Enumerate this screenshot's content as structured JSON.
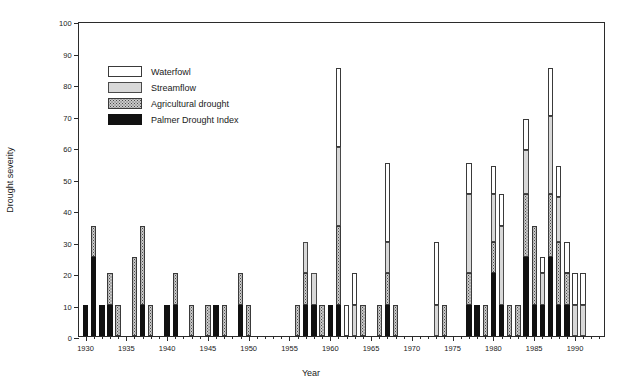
{
  "chart_data": {
    "type": "bar",
    "stacked": true,
    "title": "",
    "xlabel": "Year",
    "ylabel": "Drought severity",
    "xlim": [
      1929.2,
      1993.8
    ],
    "ylim": [
      0,
      100
    ],
    "ytick_step": 10,
    "yticks": [
      0,
      10,
      20,
      30,
      40,
      50,
      60,
      70,
      80,
      90,
      100
    ],
    "ytick_labels": [
      "0",
      "10",
      "20",
      "30",
      "40",
      "50",
      "60",
      "70",
      "80",
      "90",
      "100"
    ],
    "xticks": [
      1930,
      1935,
      1940,
      1945,
      1950,
      1955,
      1960,
      1965,
      1970,
      1975,
      1980,
      1985,
      1990
    ],
    "xtick_labels": [
      "1930",
      "1935",
      "1940",
      "1945",
      "1950",
      "1955",
      "1960",
      "1965",
      "1970",
      "1975",
      "1980",
      "1985",
      "1990"
    ],
    "xtick_minor_step": 1,
    "grid": false,
    "legend_position": "upper left",
    "series": [
      {
        "name": "Palmer Drought Index",
        "key": "palmer",
        "color": "#111111",
        "pattern": "solid-black"
      },
      {
        "name": "Agricultural drought",
        "key": "agri",
        "color": "#c9c9c9",
        "pattern": "dotted"
      },
      {
        "name": "Streamflow",
        "key": "stream",
        "color": "#d8d8d8",
        "pattern": "light-gray"
      },
      {
        "name": "Waterfowl",
        "key": "water",
        "color": "#ffffff",
        "pattern": "white"
      }
    ],
    "stack_order_bottom_to_top": [
      "palmer",
      "agri",
      "stream",
      "water"
    ],
    "categories": [
      1930,
      1931,
      1932,
      1933,
      1934,
      1935,
      1936,
      1937,
      1938,
      1939,
      1940,
      1941,
      1942,
      1943,
      1944,
      1945,
      1946,
      1947,
      1948,
      1949,
      1950,
      1951,
      1952,
      1953,
      1954,
      1955,
      1956,
      1957,
      1958,
      1959,
      1960,
      1961,
      1962,
      1963,
      1964,
      1965,
      1966,
      1967,
      1968,
      1969,
      1970,
      1971,
      1972,
      1973,
      1974,
      1975,
      1976,
      1977,
      1978,
      1979,
      1980,
      1981,
      1982,
      1983,
      1984,
      1985,
      1986,
      1987,
      1988,
      1989,
      1990,
      1991,
      1992,
      1993
    ],
    "bars": [
      {
        "year": 1930,
        "palmer": 10,
        "agri": 0,
        "stream": 0,
        "water": 0,
        "total": 10
      },
      {
        "year": 1931,
        "palmer": 25,
        "agri": 10,
        "stream": 0,
        "water": 0,
        "total": 35
      },
      {
        "year": 1932,
        "palmer": 10,
        "agri": 0,
        "stream": 0,
        "water": 0,
        "total": 10
      },
      {
        "year": 1933,
        "palmer": 10,
        "agri": 10,
        "stream": 0,
        "water": 0,
        "total": 20
      },
      {
        "year": 1934,
        "palmer": 0,
        "agri": 10,
        "stream": 0,
        "water": 0,
        "total": 10
      },
      {
        "year": 1935,
        "palmer": 0,
        "agri": 0,
        "stream": 0,
        "water": 0,
        "total": 0
      },
      {
        "year": 1936,
        "palmer": 0,
        "agri": 25,
        "stream": 0,
        "water": 0,
        "total": 25
      },
      {
        "year": 1937,
        "palmer": 10,
        "agri": 25,
        "stream": 0,
        "water": 0,
        "total": 35
      },
      {
        "year": 1938,
        "palmer": 0,
        "agri": 10,
        "stream": 0,
        "water": 0,
        "total": 10
      },
      {
        "year": 1939,
        "palmer": 0,
        "agri": 0,
        "stream": 0,
        "water": 0,
        "total": 0
      },
      {
        "year": 1940,
        "palmer": 10,
        "agri": 0,
        "stream": 0,
        "water": 0,
        "total": 10
      },
      {
        "year": 1941,
        "palmer": 10,
        "agri": 10,
        "stream": 0,
        "water": 0,
        "total": 20
      },
      {
        "year": 1942,
        "palmer": 0,
        "agri": 0,
        "stream": 0,
        "water": 0,
        "total": 0
      },
      {
        "year": 1943,
        "palmer": 0,
        "agri": 10,
        "stream": 0,
        "water": 0,
        "total": 10
      },
      {
        "year": 1944,
        "palmer": 0,
        "agri": 0,
        "stream": 0,
        "water": 0,
        "total": 0
      },
      {
        "year": 1945,
        "palmer": 0,
        "agri": 10,
        "stream": 0,
        "water": 0,
        "total": 10
      },
      {
        "year": 1946,
        "palmer": 10,
        "agri": 0,
        "stream": 0,
        "water": 0,
        "total": 10
      },
      {
        "year": 1947,
        "palmer": 0,
        "agri": 10,
        "stream": 0,
        "water": 0,
        "total": 10
      },
      {
        "year": 1948,
        "palmer": 0,
        "agri": 0,
        "stream": 0,
        "water": 0,
        "total": 0
      },
      {
        "year": 1949,
        "palmer": 10,
        "agri": 10,
        "stream": 0,
        "water": 0,
        "total": 20
      },
      {
        "year": 1950,
        "palmer": 0,
        "agri": 10,
        "stream": 0,
        "water": 0,
        "total": 10
      },
      {
        "year": 1951,
        "palmer": 0,
        "agri": 0,
        "stream": 0,
        "water": 0,
        "total": 0
      },
      {
        "year": 1952,
        "palmer": 0,
        "agri": 0,
        "stream": 0,
        "water": 0,
        "total": 0
      },
      {
        "year": 1953,
        "palmer": 0,
        "agri": 0,
        "stream": 0,
        "water": 0,
        "total": 0
      },
      {
        "year": 1954,
        "palmer": 0,
        "agri": 0,
        "stream": 0,
        "water": 0,
        "total": 0
      },
      {
        "year": 1955,
        "palmer": 0,
        "agri": 0,
        "stream": 0,
        "water": 0,
        "total": 0
      },
      {
        "year": 1956,
        "palmer": 0,
        "agri": 10,
        "stream": 0,
        "water": 0,
        "total": 10
      },
      {
        "year": 1957,
        "palmer": 10,
        "agri": 10,
        "stream": 10,
        "water": 0,
        "total": 30
      },
      {
        "year": 1958,
        "palmer": 10,
        "agri": 0,
        "stream": 10,
        "water": 0,
        "total": 20
      },
      {
        "year": 1959,
        "palmer": 0,
        "agri": 10,
        "stream": 0,
        "water": 0,
        "total": 10
      },
      {
        "year": 1960,
        "palmer": 10,
        "agri": 0,
        "stream": 0,
        "water": 0,
        "total": 10
      },
      {
        "year": 1961,
        "palmer": 10,
        "agri": 25,
        "stream": 25,
        "water": 25,
        "total": 85
      },
      {
        "year": 1962,
        "palmer": 0,
        "agri": 0,
        "stream": 0,
        "water": 10,
        "total": 10
      },
      {
        "year": 1963,
        "palmer": 0,
        "agri": 0,
        "stream": 10,
        "water": 10,
        "total": 20
      },
      {
        "year": 1964,
        "palmer": 0,
        "agri": 10,
        "stream": 0,
        "water": 0,
        "total": 10
      },
      {
        "year": 1965,
        "palmer": 0,
        "agri": 0,
        "stream": 0,
        "water": 0,
        "total": 0
      },
      {
        "year": 1966,
        "palmer": 0,
        "agri": 10,
        "stream": 0,
        "water": 0,
        "total": 10
      },
      {
        "year": 1967,
        "palmer": 10,
        "agri": 10,
        "stream": 10,
        "water": 25,
        "total": 55
      },
      {
        "year": 1968,
        "palmer": 0,
        "agri": 10,
        "stream": 0,
        "water": 0,
        "total": 10
      },
      {
        "year": 1969,
        "palmer": 0,
        "agri": 0,
        "stream": 0,
        "water": 0,
        "total": 0
      },
      {
        "year": 1970,
        "palmer": 0,
        "agri": 0,
        "stream": 0,
        "water": 0,
        "total": 0
      },
      {
        "year": 1971,
        "palmer": 0,
        "agri": 0,
        "stream": 0,
        "water": 0,
        "total": 0
      },
      {
        "year": 1972,
        "palmer": 0,
        "agri": 0,
        "stream": 0,
        "water": 0,
        "total": 0
      },
      {
        "year": 1973,
        "palmer": 0,
        "agri": 0,
        "stream": 10,
        "water": 20,
        "total": 30
      },
      {
        "year": 1974,
        "palmer": 0,
        "agri": 10,
        "stream": 0,
        "water": 0,
        "total": 10
      },
      {
        "year": 1975,
        "palmer": 0,
        "agri": 0,
        "stream": 0,
        "water": 0,
        "total": 0
      },
      {
        "year": 1976,
        "palmer": 0,
        "agri": 0,
        "stream": 0,
        "water": 0,
        "total": 0
      },
      {
        "year": 1977,
        "palmer": 10,
        "agri": 10,
        "stream": 25,
        "water": 10,
        "total": 55
      },
      {
        "year": 1978,
        "palmer": 10,
        "agri": 0,
        "stream": 0,
        "water": 0,
        "total": 10
      },
      {
        "year": 1979,
        "palmer": 0,
        "agri": 10,
        "stream": 0,
        "water": 0,
        "total": 10
      },
      {
        "year": 1980,
        "palmer": 20,
        "agri": 10,
        "stream": 15,
        "water": 9,
        "total": 54
      },
      {
        "year": 1981,
        "palmer": 10,
        "agri": 0,
        "stream": 25,
        "water": 10,
        "total": 45
      },
      {
        "year": 1982,
        "palmer": 0,
        "agri": 10,
        "stream": 0,
        "water": 0,
        "total": 10
      },
      {
        "year": 1983,
        "palmer": 0,
        "agri": 10,
        "stream": 0,
        "water": 0,
        "total": 10
      },
      {
        "year": 1984,
        "palmer": 25,
        "agri": 20,
        "stream": 14,
        "water": 10,
        "total": 69
      },
      {
        "year": 1985,
        "palmer": 10,
        "agri": 25,
        "stream": 0,
        "water": 0,
        "total": 35
      },
      {
        "year": 1986,
        "palmer": 10,
        "agri": 0,
        "stream": 10,
        "water": 5,
        "total": 25
      },
      {
        "year": 1987,
        "palmer": 25,
        "agri": 20,
        "stream": 25,
        "water": 15,
        "total": 85
      },
      {
        "year": 1988,
        "palmer": 10,
        "agri": 20,
        "stream": 14,
        "water": 10,
        "total": 54
      },
      {
        "year": 1989,
        "palmer": 10,
        "agri": 10,
        "stream": 0,
        "water": 10,
        "total": 30
      },
      {
        "year": 1990,
        "palmer": 0,
        "agri": 0,
        "stream": 10,
        "water": 10,
        "total": 20
      },
      {
        "year": 1991,
        "palmer": 0,
        "agri": 0,
        "stream": 10,
        "water": 10,
        "total": 20
      },
      {
        "year": 1992,
        "palmer": 0,
        "agri": 0,
        "stream": 0,
        "water": 0,
        "total": 0
      },
      {
        "year": 1993,
        "palmer": 0,
        "agri": 0,
        "stream": 0,
        "water": 0,
        "total": 0
      }
    ]
  },
  "legend": {
    "items": [
      {
        "label": "Waterfowl",
        "key": "water"
      },
      {
        "label": "Streamflow",
        "key": "stream"
      },
      {
        "label": "Agricultural drought",
        "key": "agri"
      },
      {
        "label": "Palmer Drought Index",
        "key": "palmer"
      }
    ]
  },
  "axes": {
    "y_title": "Drought severity",
    "x_title": "Year"
  }
}
